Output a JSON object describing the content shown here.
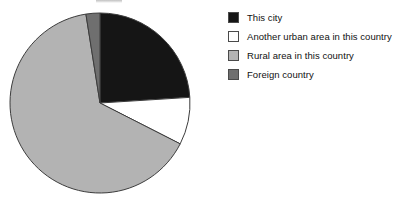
{
  "figure": {
    "background_color": "#ffffff",
    "title_visible": false,
    "title_remnant_note": "cropped title above top edge"
  },
  "chart_data": {
    "type": "pie",
    "title": "",
    "xlabel": "",
    "ylabel": "",
    "grid": false,
    "legend_position": "right",
    "start_angle_deg": 0,
    "direction": "clockwise",
    "center": {
      "x": 100,
      "y": 103
    },
    "radius": 90,
    "categories": [
      "This city",
      "Another urban area in this country",
      "Rural area in this country",
      "Foreign country"
    ],
    "values": [
      24.0,
      8.5,
      65.0,
      2.5
    ],
    "colors": [
      "#151515",
      "#ffffff",
      "#b3b3b3",
      "#6f6f6f"
    ],
    "slices": [
      {
        "label": "This city",
        "value": 24.0,
        "color": "#151515",
        "edge_color": "#3c3c3c",
        "start_deg": 0.0,
        "end_deg": 86.4
      },
      {
        "label": "Another urban area in this country",
        "value": 8.5,
        "color": "#ffffff",
        "edge_color": "#3c3c3c",
        "start_deg": 86.4,
        "end_deg": 117.0
      },
      {
        "label": "Rural area in this country",
        "value": 65.0,
        "color": "#b3b3b3",
        "edge_color": "#3c3c3c",
        "start_deg": 117.0,
        "end_deg": 351.0
      },
      {
        "label": "Foreign country",
        "value": 2.5,
        "color": "#6f6f6f",
        "edge_color": "#3c3c3c",
        "start_deg": 351.0,
        "end_deg": 360.0
      }
    ]
  },
  "legend": {
    "items": [
      {
        "label": "This city",
        "color": "#151515"
      },
      {
        "label": "Another urban area in this country",
        "color": "#ffffff"
      },
      {
        "label": "Rural area in this country",
        "color": "#b3b3b3"
      },
      {
        "label": "Foreign country",
        "color": "#6f6f6f"
      }
    ]
  }
}
